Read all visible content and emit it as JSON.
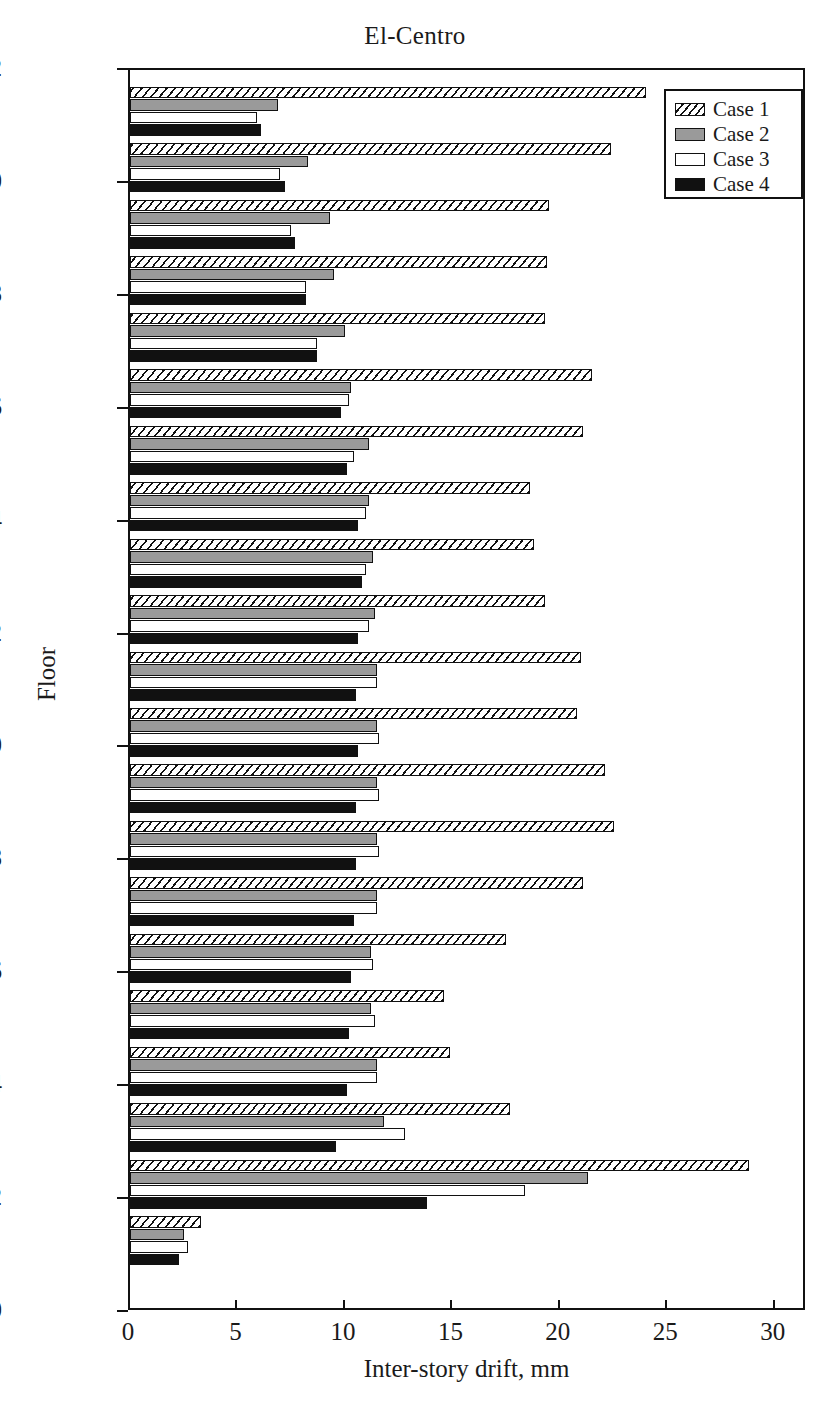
{
  "chart_data": {
    "type": "bar",
    "orientation": "horizontal",
    "title": "El-Centro",
    "xlabel": "Inter-story drift, mm",
    "ylabel": "Floor",
    "xlim": [
      0,
      31.5
    ],
    "ylim": [
      0,
      22
    ],
    "xticks": [
      0,
      5,
      10,
      15,
      20,
      25,
      30
    ],
    "yticks": [
      0,
      2,
      4,
      6,
      8,
      10,
      12,
      14,
      16,
      18,
      20,
      22
    ],
    "grid": false,
    "legend_position": "top-right",
    "categories": [
      1,
      2,
      3,
      4,
      5,
      6,
      7,
      8,
      9,
      10,
      11,
      12,
      13,
      14,
      15,
      16,
      17,
      18,
      19,
      20,
      21
    ],
    "series": [
      {
        "name": "Case 1",
        "style": "hatched",
        "color": "#ffffff",
        "values": [
          3.3,
          28.8,
          17.7,
          14.9,
          14.6,
          17.5,
          21.1,
          22.5,
          22.1,
          20.8,
          21.0,
          19.3,
          18.8,
          18.6,
          21.1,
          21.5,
          19.3,
          19.4,
          19.5,
          22.4,
          24.0
        ]
      },
      {
        "name": "Case 2",
        "style": "solid",
        "color": "#9a9a9a",
        "values": [
          2.5,
          21.3,
          11.8,
          11.5,
          11.2,
          11.2,
          11.5,
          11.5,
          11.5,
          11.5,
          11.5,
          11.4,
          11.3,
          11.1,
          11.1,
          10.3,
          10.0,
          9.5,
          9.3,
          8.3,
          6.9
        ]
      },
      {
        "name": "Case 3",
        "style": "solid",
        "color": "#ffffff",
        "values": [
          2.7,
          18.4,
          12.8,
          11.5,
          11.4,
          11.3,
          11.5,
          11.6,
          11.6,
          11.6,
          11.5,
          11.1,
          11.0,
          11.0,
          10.4,
          10.2,
          8.7,
          8.2,
          7.5,
          7.0,
          5.9
        ]
      },
      {
        "name": "Case 4",
        "style": "solid",
        "color": "#111111",
        "values": [
          2.3,
          13.8,
          9.6,
          10.1,
          10.2,
          10.3,
          10.4,
          10.5,
          10.5,
          10.6,
          10.5,
          10.6,
          10.8,
          10.6,
          10.1,
          9.8,
          8.7,
          8.2,
          7.7,
          7.2,
          6.1
        ]
      }
    ]
  },
  "legend": {
    "items": [
      {
        "label": "Case 1"
      },
      {
        "label": "Case 2"
      },
      {
        "label": "Case 3"
      },
      {
        "label": "Case 4"
      }
    ]
  }
}
